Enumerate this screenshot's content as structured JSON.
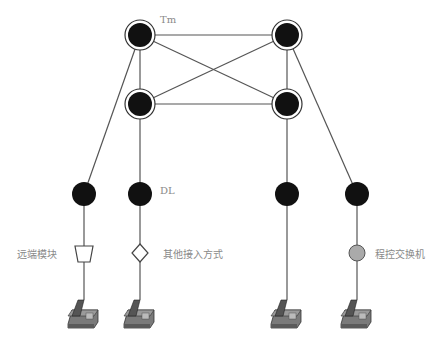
{
  "diagram": {
    "labels": {
      "tm": "Tm",
      "dl": "DL",
      "remote_module": "远端模块",
      "other_access": "其他接入方式",
      "pbx": "程控交换机"
    },
    "nodes": {
      "tm": [
        {
          "id": "tm-top-left",
          "x": 140,
          "y": 35
        },
        {
          "id": "tm-top-right",
          "x": 287,
          "y": 35
        },
        {
          "id": "tm-mid-left",
          "x": 140,
          "y": 104
        },
        {
          "id": "tm-mid-right",
          "x": 287,
          "y": 104
        }
      ],
      "dl": [
        {
          "id": "dl-1",
          "x": 84,
          "y": 194
        },
        {
          "id": "dl-2",
          "x": 140,
          "y": 194
        },
        {
          "id": "dl-3",
          "x": 287,
          "y": 194
        },
        {
          "id": "dl-4",
          "x": 357,
          "y": 194
        }
      ],
      "access": [
        {
          "id": "remote-module",
          "shape": "trapezoid",
          "x": 84,
          "y": 253
        },
        {
          "id": "other-access",
          "shape": "diamond",
          "x": 140,
          "y": 253
        },
        {
          "id": "pbx",
          "shape": "circle",
          "x": 357,
          "y": 253
        }
      ],
      "phones": [
        {
          "id": "phone-1",
          "x": 84,
          "y": 310
        },
        {
          "id": "phone-2",
          "x": 140,
          "y": 310
        },
        {
          "id": "phone-3",
          "x": 287,
          "y": 310
        },
        {
          "id": "phone-4",
          "x": 357,
          "y": 310
        }
      ]
    },
    "colors": {
      "node_fill": "#111111",
      "line": "#555555",
      "pbx_fill": "#aaaaaa",
      "label": "#8a8a8a",
      "phone_body": "#6e6e6e"
    }
  }
}
